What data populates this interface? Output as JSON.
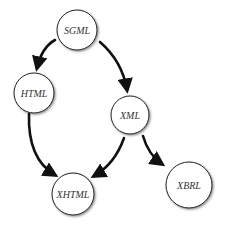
{
  "diagram": {
    "type": "directed-graph",
    "nodes": [
      {
        "id": "sgml",
        "label": "SGML",
        "cx": 77,
        "cy": 30,
        "r": 20
      },
      {
        "id": "html",
        "label": "HTML",
        "cx": 34,
        "cy": 93,
        "r": 20
      },
      {
        "id": "xml",
        "label": "XML",
        "cx": 130,
        "cy": 115,
        "r": 19
      },
      {
        "id": "xhtml",
        "label": "XHTML",
        "cx": 73,
        "cy": 194,
        "r": 21
      },
      {
        "id": "xbrl",
        "label": "XBRL",
        "cx": 189,
        "cy": 185,
        "r": 23
      }
    ],
    "edges": [
      {
        "from": "SGML",
        "to": "HTML"
      },
      {
        "from": "SGML",
        "to": "XML"
      },
      {
        "from": "HTML",
        "to": "XHTML"
      },
      {
        "from": "XML",
        "to": "XHTML"
      },
      {
        "from": "XML",
        "to": "XBRL"
      }
    ]
  }
}
